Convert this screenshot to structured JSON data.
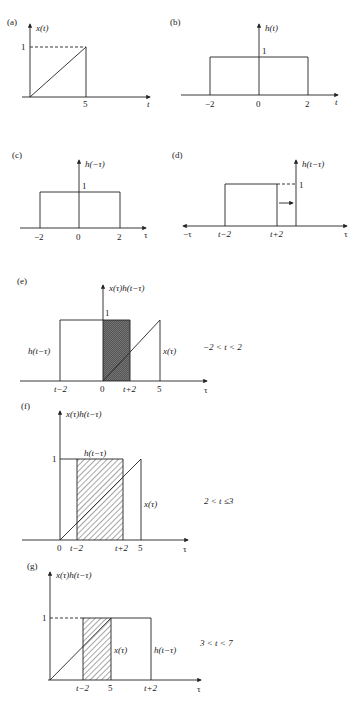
{
  "panels": {
    "a": {
      "label": "(a)",
      "ylabel": "x(t)",
      "xlabel": "t",
      "y_tick": "1",
      "x_tick": "5"
    },
    "b": {
      "label": "(b)",
      "ylabel": "h(t)",
      "xlabel": "t",
      "y_tick": "1",
      "x_ticks": [
        "−2",
        "0",
        "2"
      ]
    },
    "c": {
      "label": "(c)",
      "ylabel": "h(−τ)",
      "xlabel": "τ",
      "y_tick": "1",
      "x_ticks": [
        "−2",
        "0",
        "2"
      ]
    },
    "d": {
      "label": "(d)",
      "ylabel": "h(t−τ)",
      "xlabel": "τ",
      "xlabel_neg": "−τ",
      "y_tick": "1",
      "x_ticks": [
        "t−2",
        "t+2"
      ]
    },
    "e": {
      "label": "(e)",
      "ylabel": "x(τ)h(t−τ)",
      "xlabel": "τ",
      "y_tick": "1",
      "x_ticks": [
        "t−2",
        "0",
        "t+2",
        "5"
      ],
      "h_label": "h(t−τ)",
      "x_label": "x(τ)",
      "condition": "−2 < t < 2"
    },
    "f": {
      "label": "(f)",
      "ylabel": "x(τ)h(t−τ)",
      "xlabel": "τ",
      "y_tick": "1",
      "x_ticks": [
        "0",
        "t−2",
        "t+2",
        "5"
      ],
      "h_label": "h(t−τ)",
      "x_label": "x(τ)",
      "condition": "2 < t ≤3"
    },
    "g": {
      "label": "(g)",
      "ylabel": "x(τ)h(t−τ)",
      "xlabel": "τ",
      "y_tick": "1",
      "x_ticks": [
        "t−2",
        "5",
        "t+2"
      ],
      "h_label": "h(t−τ)",
      "x_label": "x(τ)",
      "condition": "3 < t < 7"
    }
  }
}
